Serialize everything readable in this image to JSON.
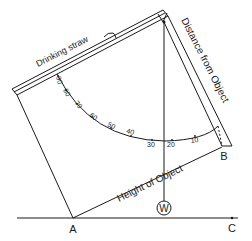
{
  "diagram": {
    "labels": {
      "straw": "Drinking straw",
      "distance": "Distance from Object",
      "height": "Height of Object",
      "point_a": "A",
      "point_b": "B",
      "point_c": "C",
      "weight": "W"
    },
    "protractor_ticks": [
      "90",
      "80",
      "70",
      "60",
      "50",
      "40",
      "30",
      "20",
      "10"
    ],
    "colors": {
      "ink": "#1a1a1a",
      "background": "#ffffff"
    }
  }
}
